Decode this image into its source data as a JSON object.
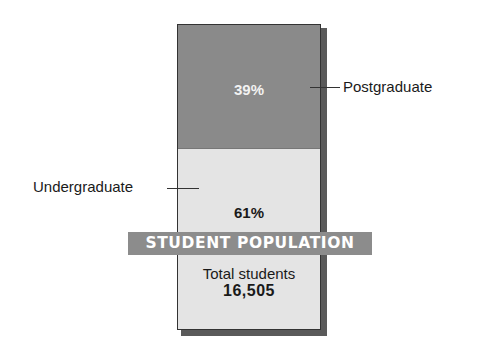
{
  "chart_data": {
    "type": "bar",
    "subtype": "100% stacked single column",
    "title": "STUDENT POPULATION",
    "categories": [
      "Student population"
    ],
    "series": [
      {
        "name": "Undergraduate",
        "values": [
          61
        ],
        "label": "61%",
        "color": "#e4e4e4"
      },
      {
        "name": "Postgraduate",
        "values": [
          39
        ],
        "label": "39%",
        "color": "#8a8a8a"
      }
    ],
    "annotations": [
      {
        "text": "Total students",
        "value": "16,505"
      }
    ],
    "xlabel": "",
    "ylabel": "",
    "ylim": [
      0,
      100
    ],
    "grid": false,
    "legend_position": "leader-line labels beside segments"
  },
  "segments": {
    "postgraduate": {
      "name": "Postgraduate",
      "percent": "39%"
    },
    "undergraduate": {
      "name": "Undergraduate",
      "percent": "61%"
    }
  },
  "banner": {
    "title": "STUDENT POPULATION"
  },
  "total": {
    "label": "Total students",
    "value": "16,505"
  }
}
